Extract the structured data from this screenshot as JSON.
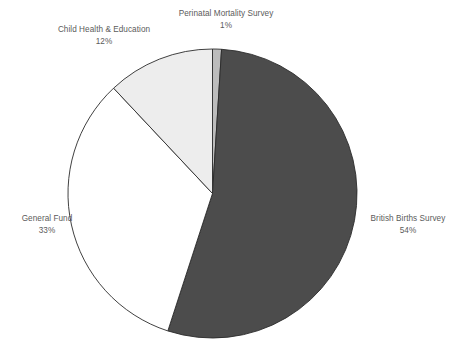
{
  "chart_data": {
    "type": "pie",
    "title": "",
    "categories": [
      "Perinatal Mortality Survey",
      "British Births Survey",
      "General Fund",
      "Child Health & Education"
    ],
    "values": [
      1,
      54,
      33,
      12
    ],
    "value_labels": [
      "1%",
      "54%",
      "33%",
      "12%"
    ],
    "units": "percent",
    "start_angle_deg": 0,
    "direction": "clockwise",
    "legend": "none",
    "labels_position": "outside",
    "slice_colors": [
      "#bcbcbc",
      "#4c4c4c",
      "#ffffff",
      "#ededed"
    ],
    "slice_border_color": "#2b2b2b",
    "series": [
      {
        "name": "Share of funding",
        "values": [
          1,
          54,
          33,
          12
        ]
      }
    ]
  },
  "chart": {
    "background": "#ffffff",
    "label_color": "#5b5b5b",
    "outline_color": "#2b2b2b"
  },
  "slices": [
    {
      "key": "perinatal",
      "name": "Perinatal Mortality Survey",
      "value": "1%",
      "color": "#bcbcbc"
    },
    {
      "key": "british",
      "name": "British Births Survey",
      "value": "54%",
      "color": "#4c4c4c"
    },
    {
      "key": "general",
      "name": "General Fund",
      "value": "33%",
      "color": "#ffffff"
    },
    {
      "key": "child",
      "name": "Child Health & Education",
      "value": "12%",
      "color": "#ededed"
    }
  ]
}
